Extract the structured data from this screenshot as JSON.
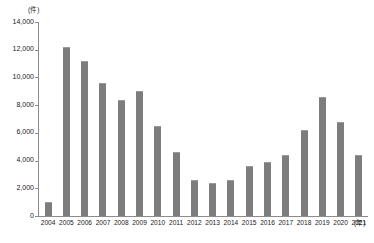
{
  "chart_data": {
    "type": "bar",
    "title": "",
    "xlabel": "(年)",
    "ylabel": "(件)",
    "categories": [
      "2004",
      "2005",
      "2006",
      "2007",
      "2008",
      "2009",
      "2010",
      "2011",
      "2012",
      "2013",
      "2014",
      "2015",
      "2016",
      "2017",
      "2018",
      "2019",
      "2020",
      "2021"
    ],
    "values": [
      1000,
      12200,
      11200,
      9600,
      8400,
      9000,
      6500,
      4600,
      2600,
      2400,
      2600,
      3600,
      3900,
      4400,
      6200,
      8600,
      6800,
      4400
    ],
    "ylim": [
      0,
      14000
    ],
    "ytick_labels": [
      "14,000",
      "12,000",
      "10,000",
      "8,000",
      "6,000",
      "4,000",
      "2,000",
      "0"
    ],
    "ytick_values": [
      14000,
      12000,
      10000,
      8000,
      6000,
      4000,
      2000,
      0
    ],
    "grid": false,
    "legend": null,
    "series": [
      {
        "name": "",
        "color": "#7d7d7d",
        "values": [
          1000,
          12200,
          11200,
          9600,
          8400,
          9000,
          6500,
          4600,
          2600,
          2400,
          2600,
          3600,
          3900,
          4400,
          6200,
          8600,
          6800,
          4400
        ]
      }
    ]
  },
  "axes": {
    "y_unit": "(件)",
    "x_unit": "(年)",
    "axis_color": "#8c8c8c"
  }
}
